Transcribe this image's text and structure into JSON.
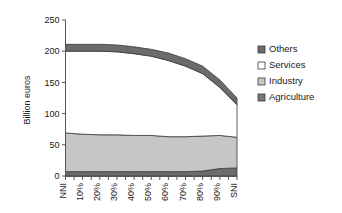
{
  "chart_data": {
    "type": "area",
    "stacked": true,
    "title": "",
    "xlabel": "",
    "ylabel": "Billion euros",
    "ylim": [
      0,
      250
    ],
    "yticks": [
      0,
      50,
      100,
      150,
      200,
      250
    ],
    "grid": false,
    "legend_position": "right",
    "categories": [
      "NNI",
      "10%",
      "20%",
      "30%",
      "40%",
      "50%",
      "60%",
      "70%",
      "80%",
      "90%",
      "SNI"
    ],
    "series": [
      {
        "name": "Agriculture",
        "color": "#6b6b6b",
        "values": [
          7,
          7,
          7,
          7,
          7,
          7,
          7,
          7,
          8,
          12,
          13
        ]
      },
      {
        "name": "Industry",
        "color": "#c6c6c6",
        "values": [
          62,
          60,
          59,
          59,
          58,
          58,
          56,
          56,
          56,
          53,
          49
        ]
      },
      {
        "name": "Services",
        "color": "#ffffff",
        "values": [
          131,
          133,
          134,
          133,
          131,
          127,
          122,
          113,
          100,
          77,
          52
        ]
      },
      {
        "name": "Others",
        "color": "#6b6b6b",
        "values": [
          11,
          11,
          11,
          11,
          11,
          11,
          12,
          12,
          12,
          12,
          11
        ]
      }
    ],
    "totals": [
      211,
      211,
      211,
      210,
      207,
      203,
      197,
      188,
      176,
      154,
      125
    ]
  },
  "legend": {
    "items": [
      {
        "label": "Others",
        "swatch": "#6b6b6b",
        "filled": true
      },
      {
        "label": "Services",
        "swatch": "#ffffff",
        "filled": false
      },
      {
        "label": "Industry",
        "swatch": "#c6c6c6",
        "filled": true
      },
      {
        "label": "Agriculture",
        "swatch": "#787878",
        "filled": true
      }
    ]
  },
  "axes": {
    "y_title": "Billion euros",
    "y_tick_labels": [
      "250",
      "200",
      "150",
      "100",
      "50",
      "0"
    ],
    "x_tick_labels": [
      "NNI",
      "10%",
      "20%",
      "30%",
      "40%",
      "50%",
      "60%",
      "70%",
      "80%",
      "90%",
      "SNI"
    ]
  },
  "colors": {
    "axis": "#555555",
    "outline": "#3a3a3a",
    "text": "#1a1a1a",
    "background": "#ffffff"
  }
}
